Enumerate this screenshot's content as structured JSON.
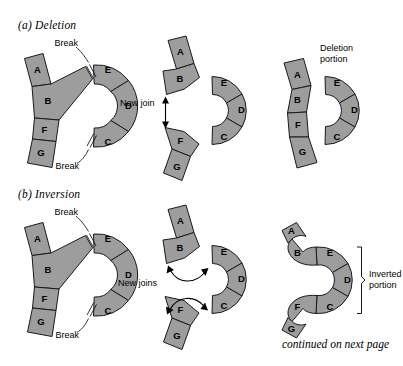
{
  "figure": {
    "footer_note": "continued on next page",
    "panels": [
      {
        "id": "deletion",
        "title": "(a) Deletion",
        "stages": [
          {
            "id": "a-stage-1",
            "name": "intact-chromosome-with-breaks",
            "segments": [
              "A",
              "B",
              "F",
              "G",
              "E",
              "D",
              "C"
            ],
            "callouts": [
              "Break",
              "Break"
            ]
          },
          {
            "id": "a-stage-2",
            "name": "separated-fragments",
            "segments": [
              "A",
              "B",
              "F",
              "G",
              "E",
              "D",
              "C"
            ],
            "callouts": [
              "New join"
            ]
          },
          {
            "id": "a-stage-3",
            "name": "result-after-deletion",
            "segments": [
              "A",
              "B",
              "F",
              "G",
              "E",
              "D",
              "C"
            ],
            "callouts": [
              "Deletion portion"
            ]
          }
        ]
      },
      {
        "id": "inversion",
        "title": "(b) Inversion",
        "stages": [
          {
            "id": "b-stage-1",
            "name": "intact-chromosome-with-breaks",
            "segments": [
              "A",
              "B",
              "F",
              "G",
              "E",
              "D",
              "C"
            ],
            "callouts": [
              "Break",
              "Break"
            ]
          },
          {
            "id": "b-stage-2",
            "name": "fragments-rejoining",
            "segments": [
              "A",
              "B",
              "F",
              "G",
              "E",
              "D",
              "C"
            ],
            "callouts": [
              "New joins"
            ]
          },
          {
            "id": "b-stage-3",
            "name": "result-after-inversion",
            "segments": [
              "A",
              "B",
              "F",
              "G",
              "E",
              "D",
              "C"
            ],
            "callouts": [
              "Inverted portion"
            ]
          }
        ]
      }
    ],
    "labels": {
      "break": "Break",
      "new_join": "New join",
      "new_joins": "New joins",
      "deletion_portion_line1": "Deletion",
      "deletion_portion_line2": "portion",
      "inverted_portion_line1": "Inverted",
      "inverted_portion_line2": "portion",
      "seg_a": "A",
      "seg_b": "B",
      "seg_c": "C",
      "seg_d": "D",
      "seg_e": "E",
      "seg_f": "F",
      "seg_g": "G"
    },
    "colors": {
      "segment_fill": "#9d9d9d",
      "segment_stroke": "#1a1a1a",
      "background": "#ffffff",
      "text": "#000000"
    }
  }
}
